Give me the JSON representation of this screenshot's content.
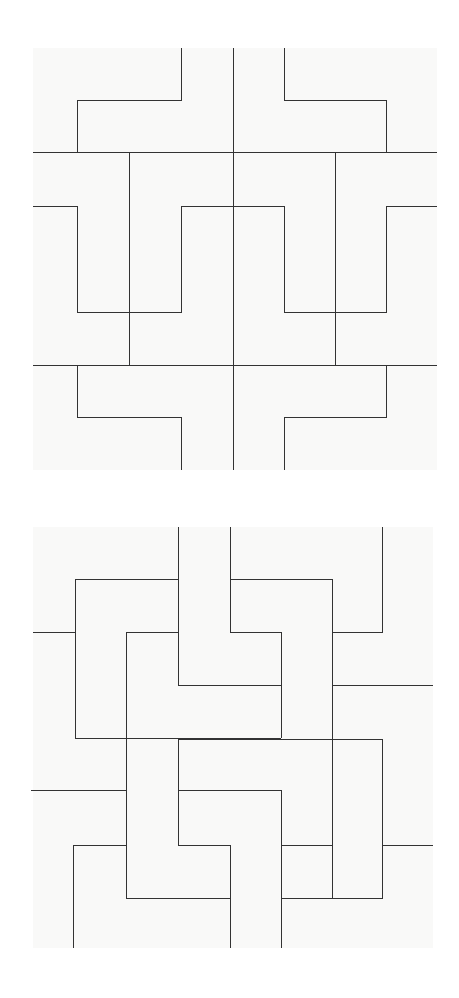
{
  "figures": [
    {
      "id": "symmetric-tiling",
      "stroke_color": "#333333",
      "background": "#f9f9f8",
      "bbox": [
        33,
        48,
        437,
        470
      ],
      "paths": [
        [
          [
            181,
            48
          ],
          [
            181,
            100
          ],
          [
            77,
            100
          ],
          [
            77,
            152
          ]
        ],
        [
          [
            233,
            48
          ],
          [
            233,
            470
          ]
        ],
        [
          [
            284,
            48
          ],
          [
            284,
            100
          ],
          [
            386,
            100
          ],
          [
            386,
            152
          ]
        ],
        [
          [
            33,
            152
          ],
          [
            437,
            152
          ]
        ],
        [
          [
            129,
            152
          ],
          [
            129,
            365
          ]
        ],
        [
          [
            335,
            152
          ],
          [
            335,
            365
          ]
        ],
        [
          [
            33,
            206
          ],
          [
            77,
            206
          ],
          [
            77,
            312
          ],
          [
            181,
            312
          ],
          [
            181,
            206
          ],
          [
            284,
            206
          ],
          [
            284,
            312
          ],
          [
            386,
            312
          ],
          [
            386,
            206
          ],
          [
            437,
            206
          ]
        ],
        [
          [
            33,
            365
          ],
          [
            437,
            365
          ]
        ],
        [
          [
            77,
            365
          ],
          [
            77,
            417
          ],
          [
            181,
            417
          ],
          [
            181,
            470
          ]
        ],
        [
          [
            386,
            365
          ],
          [
            386,
            417
          ],
          [
            284,
            417
          ],
          [
            284,
            470
          ]
        ]
      ]
    },
    {
      "id": "pinwheel-tiling",
      "stroke_color": "#333333",
      "background": "#f9f9f8",
      "bbox": [
        31,
        527,
        433,
        948
      ],
      "paths": [
        [
          [
            178,
            527
          ],
          [
            178,
            685
          ],
          [
            281,
            685
          ],
          [
            281,
            738
          ]
        ],
        [
          [
            230,
            527
          ],
          [
            230,
            632
          ],
          [
            281,
            632
          ],
          [
            281,
            738
          ]
        ],
        [
          [
            382,
            527
          ],
          [
            382,
            632
          ],
          [
            332,
            632
          ]
        ],
        [
          [
            178,
            579
          ],
          [
            75,
            579
          ],
          [
            75,
            738
          ],
          [
            281,
            738
          ]
        ],
        [
          [
            230,
            579
          ],
          [
            332,
            579
          ],
          [
            332,
            898
          ]
        ],
        [
          [
            33,
            632
          ],
          [
            75,
            632
          ]
        ],
        [
          [
            178,
            632
          ],
          [
            126,
            632
          ],
          [
            126,
            898
          ],
          [
            230,
            898
          ],
          [
            230,
            845
          ],
          [
            178,
            845
          ],
          [
            178,
            739
          ],
          [
            382,
            739
          ],
          [
            382,
            845
          ],
          [
            433,
            845
          ]
        ],
        [
          [
            332,
            685
          ],
          [
            433,
            685
          ]
        ],
        [
          [
            31,
            790
          ],
          [
            126,
            790
          ]
        ],
        [
          [
            178,
            790
          ],
          [
            281,
            790
          ],
          [
            281,
            948
          ]
        ],
        [
          [
            126,
            845
          ],
          [
            73,
            845
          ],
          [
            73,
            948
          ]
        ],
        [
          [
            230,
            898
          ],
          [
            230,
            948
          ]
        ],
        [
          [
            281,
            845
          ],
          [
            332,
            845
          ]
        ],
        [
          [
            382,
            845
          ],
          [
            382,
            898
          ],
          [
            281,
            898
          ]
        ]
      ]
    }
  ]
}
